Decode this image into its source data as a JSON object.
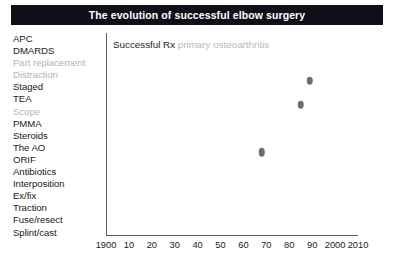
{
  "title": {
    "text": "The evolution of successful elbow surgery",
    "background": "#100f19",
    "color": "#ffffff"
  },
  "sidebar": {
    "items": [
      {
        "label": "APC",
        "muted": false
      },
      {
        "label": "DMARDS",
        "muted": false
      },
      {
        "label": "Part replacement",
        "muted": true
      },
      {
        "label": "Distraction",
        "muted": true
      },
      {
        "label": "Staged",
        "muted": false
      },
      {
        "label": "TEA",
        "muted": false
      },
      {
        "label": "Scope",
        "muted": true
      },
      {
        "label": "PMMA",
        "muted": false
      },
      {
        "label": "Steroids",
        "muted": false
      },
      {
        "label": "The AO",
        "muted": false
      },
      {
        "label": "ORIF",
        "muted": false
      },
      {
        "label": "Antibiotics",
        "muted": false
      },
      {
        "label": "Interposition",
        "muted": false
      },
      {
        "label": "Ex/fix",
        "muted": false
      },
      {
        "label": "Traction",
        "muted": false
      },
      {
        "label": "Fuse/resect",
        "muted": false
      },
      {
        "label": "Splint/cast",
        "muted": false
      }
    ]
  },
  "caption": {
    "strong": "Successful Rx",
    "faint": " primary osteoarthritis"
  },
  "chart_data": {
    "type": "scatter",
    "title": "The evolution of successful elbow surgery",
    "xlabel": "",
    "ylabel": "",
    "grid": false,
    "legend": null,
    "xlim": [
      1900,
      2010
    ],
    "ylim": [
      0,
      17
    ],
    "xticks": [
      1900,
      1910,
      1920,
      1930,
      1940,
      1950,
      1960,
      1970,
      1980,
      1990,
      2000,
      2010
    ],
    "xticklabels": [
      "1900",
      "10",
      "20",
      "30",
      "40",
      "50",
      "60",
      "70",
      "80",
      "90",
      "2000",
      "2010"
    ],
    "yticklabels": [
      "Splint/cast",
      "Fuse/resect",
      "Traction",
      "Ex/fix",
      "Interposition",
      "Antibiotics",
      "ORIF",
      "The AO",
      "Steroids",
      "PMMA",
      "Scope",
      "TEA",
      "Staged",
      "Distraction",
      "Part replacement",
      "DMARDS",
      "APC"
    ],
    "series": [
      {
        "name": "Successful Rx primary osteoarthritis",
        "color": "#6e6e6e",
        "points": [
          {
            "x": 1968,
            "y": 7,
            "label": "Scope"
          },
          {
            "x": 1985,
            "y": 11,
            "label": "Staged"
          },
          {
            "x": 1989,
            "y": 13,
            "label": "Part replacement"
          }
        ]
      }
    ]
  },
  "axis_colors": {
    "line": "#5a5a5a",
    "text": "#1a1a1a",
    "muted_text": "#b4b4b4"
  }
}
